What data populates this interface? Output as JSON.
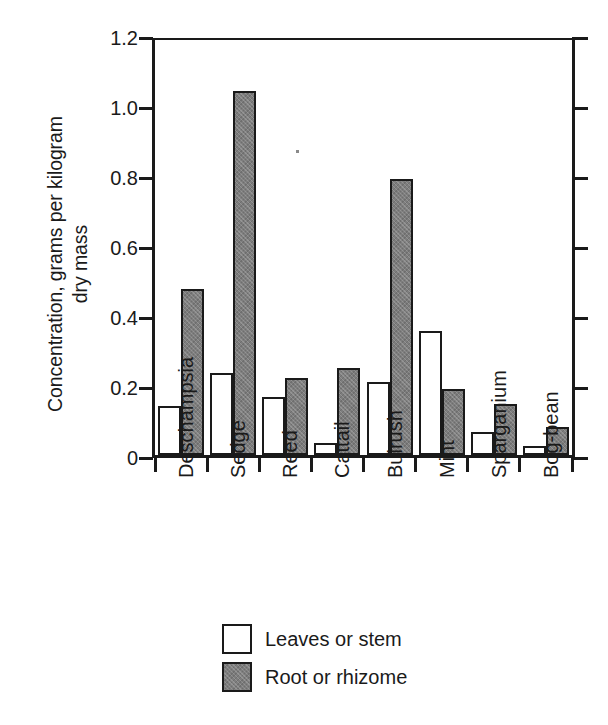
{
  "chart_data": {
    "type": "bar",
    "title": "",
    "subtitle": "",
    "xlabel": "",
    "ylabel": "Concentration, grams per kilogram dry mass",
    "ylabel_lines": [
      "Concentration, grams per kilogram",
      "dry mass"
    ],
    "ylim": [
      0,
      1.2
    ],
    "ytick_labels": [
      "0",
      "0.2",
      "0.4",
      "0.6",
      "0.8",
      "1.0",
      "1.2"
    ],
    "ytick_values": [
      0,
      0.2,
      0.4,
      0.6,
      0.8,
      1.0,
      1.2
    ],
    "grid": false,
    "legend_position": "bottom-center",
    "categories": [
      "Deschampsia",
      "Sedge",
      "Reed",
      "Cattail",
      "Bulrush",
      "Mint",
      "Sparganium",
      "Bog-bean"
    ],
    "series": [
      {
        "name": "Leaves or stem",
        "fill": "#ffffff",
        "values": [
          0.14,
          0.235,
          0.165,
          0.035,
          0.21,
          0.355,
          0.065,
          0.025
        ]
      },
      {
        "name": "Root or rhizome",
        "fill": "#7d7d7d",
        "values": [
          0.475,
          1.04,
          0.22,
          0.25,
          0.79,
          0.19,
          0.145,
          0.08
        ]
      }
    ]
  },
  "legend": {
    "items": [
      {
        "label": "Leaves or stem",
        "swatch": "white-square-swatch"
      },
      {
        "label": "Root or rhizome",
        "swatch": "gray-hatched-square-swatch"
      }
    ]
  },
  "colors": {
    "axis": "#1a1a1a",
    "leaves_fill": "#ffffff",
    "root_fill": "#7d7d7d",
    "background": "#ffffff"
  }
}
